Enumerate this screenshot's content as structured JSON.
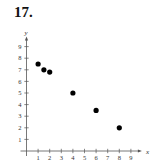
{
  "problem_number": "17.",
  "chart_data": {
    "type": "scatter",
    "title": "",
    "xlabel": "x",
    "ylabel": "y",
    "xlim": [
      0,
      9
    ],
    "ylim": [
      0,
      9
    ],
    "x_ticks": [
      1,
      2,
      3,
      4,
      5,
      6,
      7,
      8,
      9
    ],
    "y_ticks": [
      1,
      2,
      3,
      4,
      5,
      6,
      7,
      8,
      9
    ],
    "grid": false,
    "legend": null,
    "series": [
      {
        "name": "points",
        "x": [
          1,
          1.5,
          2,
          4,
          6,
          8
        ],
        "y": [
          7.5,
          7,
          6.8,
          5,
          3.5,
          2
        ]
      }
    ]
  },
  "colors": {
    "axis": "#555555",
    "points": "#000000"
  }
}
